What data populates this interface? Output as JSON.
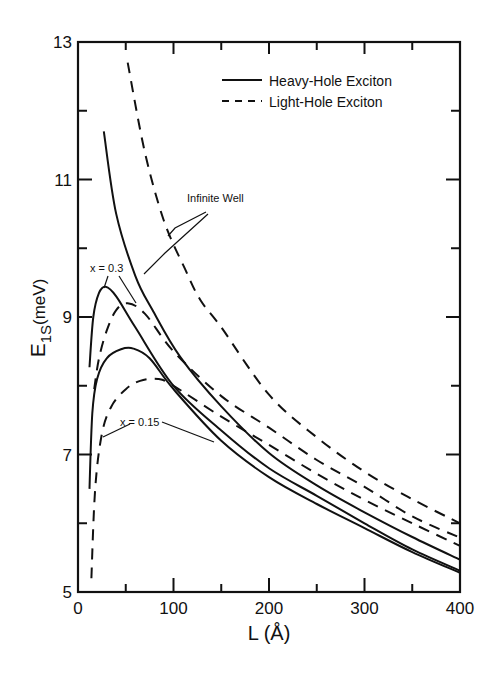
{
  "chart_data": {
    "type": "line",
    "title": "",
    "xlabel": "L (Å)",
    "ylabel_main": "E",
    "ylabel_sub": "1S",
    "ylabel_unit": "(meV)",
    "xlim": [
      0,
      400
    ],
    "ylim": [
      5,
      13
    ],
    "x_major_ticks": [
      0,
      100,
      200,
      300,
      400
    ],
    "x_minor_ticks": [
      50,
      150,
      250,
      350
    ],
    "y_major_ticks": [
      5,
      7,
      9,
      11,
      13
    ],
    "y_minor_ticks": [
      6,
      8,
      10,
      12
    ],
    "grid": false,
    "legend": {
      "position": "upper right",
      "entries": [
        {
          "label": "Heavy-Hole Exciton",
          "style": "solid"
        },
        {
          "label": "Light-Hole Exciton",
          "style": "dashed"
        }
      ]
    },
    "series": [
      {
        "name": "Heavy-Hole Exciton, Infinite Well",
        "style": "solid",
        "x": [
          27,
          40,
          60,
          78,
          107,
          150,
          200,
          250,
          300,
          350,
          400
        ],
        "y": [
          11.7,
          10.5,
          9.6,
          9.1,
          8.42,
          7.7,
          7.02,
          6.55,
          6.16,
          5.8,
          5.47
        ]
      },
      {
        "name": "Light-Hole Exciton, Infinite Well",
        "style": "dashed",
        "x": [
          52,
          70,
          90,
          112,
          128,
          150,
          200,
          250,
          300,
          350,
          400
        ],
        "y": [
          12.7,
          11.4,
          10.4,
          9.7,
          9.25,
          8.85,
          7.87,
          7.25,
          6.75,
          6.35,
          6.0
        ]
      },
      {
        "name": "Heavy-Hole Exciton, x = 0.3",
        "style": "solid",
        "x": [
          12,
          16,
          22,
          29,
          40,
          60,
          100,
          150,
          200,
          250,
          300,
          350,
          400
        ],
        "y": [
          8.27,
          9.0,
          9.35,
          9.44,
          9.3,
          8.85,
          8.0,
          7.35,
          6.8,
          6.4,
          6.0,
          5.62,
          5.31
        ]
      },
      {
        "name": "Light-Hole Exciton, x = 0.3",
        "style": "dashed",
        "x": [
          17,
          22,
          30,
          40,
          52,
          70,
          100,
          150,
          200,
          250,
          300,
          350,
          400
        ],
        "y": [
          7.95,
          8.4,
          8.8,
          9.1,
          9.2,
          9.05,
          8.5,
          7.85,
          7.39,
          6.92,
          6.53,
          6.1,
          5.79
        ]
      },
      {
        "name": "Heavy-Hole Exciton, x = 0.15",
        "style": "solid",
        "x": [
          12,
          15,
          20,
          30,
          45,
          58,
          75,
          100,
          150,
          200,
          250,
          300,
          350,
          400
        ],
        "y": [
          6.5,
          7.6,
          8.1,
          8.4,
          8.53,
          8.54,
          8.4,
          7.95,
          7.2,
          6.67,
          6.28,
          5.93,
          5.58,
          5.28
        ]
      },
      {
        "name": "Light-Hole Exciton, x = 0.15",
        "style": "dashed",
        "x": [
          14,
          18,
          25,
          35,
          50,
          65,
          84,
          100,
          150,
          200,
          250,
          300,
          350,
          400
        ],
        "y": [
          5.2,
          6.5,
          7.3,
          7.7,
          7.95,
          8.07,
          8.1,
          8.0,
          7.55,
          7.14,
          6.72,
          6.34,
          6.0,
          5.67
        ]
      }
    ],
    "annotations": [
      {
        "text": "Infinite Well",
        "x": 150,
        "y": 10.85
      },
      {
        "text": "x = 0.3",
        "x": 18,
        "y": 9.7
      },
      {
        "text": "x = 0.15",
        "x": 45,
        "y": 7.45
      }
    ]
  }
}
